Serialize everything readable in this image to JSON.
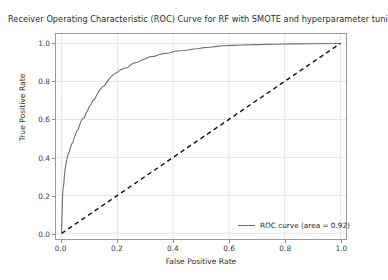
{
  "chart_data": {
    "type": "line",
    "title": "Receiver Operating Characteristic (ROC) Curve for RF with SMOTE and hyperparameter tuning",
    "xlabel": "False Positive Rate",
    "ylabel": "True Positive Rate",
    "xlim": [
      -0.02,
      1.02
    ],
    "ylim": [
      -0.03,
      1.05
    ],
    "xticks": [
      "0.0",
      "0.2",
      "0.4",
      "0.6",
      "0.8",
      "1.0"
    ],
    "xtick_values": [
      0.0,
      0.2,
      0.4,
      0.6,
      0.8,
      1.0
    ],
    "yticks": [
      "0.0",
      "0.2",
      "0.4",
      "0.6",
      "0.8",
      "1.0"
    ],
    "ytick_values": [
      0.0,
      0.2,
      0.4,
      0.6,
      0.8,
      1.0
    ],
    "grid": true,
    "grid_color": "#e6e6e6",
    "legend_position": "lower right",
    "series": [
      {
        "name": "ROC curve (area = 0.92)",
        "style": "solid",
        "color": "#6f6f6f",
        "auc": 0.92,
        "points": [
          [
            0.0,
            0.0
          ],
          [
            0.004,
            0.215
          ],
          [
            0.006,
            0.24
          ],
          [
            0.008,
            0.262
          ],
          [
            0.01,
            0.3
          ],
          [
            0.012,
            0.33
          ],
          [
            0.014,
            0.352
          ],
          [
            0.017,
            0.375
          ],
          [
            0.02,
            0.398
          ],
          [
            0.024,
            0.42
          ],
          [
            0.028,
            0.43
          ],
          [
            0.032,
            0.452
          ],
          [
            0.036,
            0.47
          ],
          [
            0.04,
            0.478
          ],
          [
            0.045,
            0.5
          ],
          [
            0.05,
            0.52
          ],
          [
            0.055,
            0.54
          ],
          [
            0.06,
            0.548
          ],
          [
            0.064,
            0.568
          ],
          [
            0.07,
            0.59
          ],
          [
            0.076,
            0.605
          ],
          [
            0.082,
            0.61
          ],
          [
            0.088,
            0.632
          ],
          [
            0.094,
            0.65
          ],
          [
            0.1,
            0.668
          ],
          [
            0.106,
            0.68
          ],
          [
            0.112,
            0.7
          ],
          [
            0.118,
            0.705
          ],
          [
            0.124,
            0.722
          ],
          [
            0.13,
            0.74
          ],
          [
            0.138,
            0.758
          ],
          [
            0.146,
            0.77
          ],
          [
            0.154,
            0.778
          ],
          [
            0.162,
            0.795
          ],
          [
            0.17,
            0.812
          ],
          [
            0.18,
            0.828
          ],
          [
            0.19,
            0.84
          ],
          [
            0.2,
            0.848
          ],
          [
            0.212,
            0.862
          ],
          [
            0.224,
            0.87
          ],
          [
            0.236,
            0.872
          ],
          [
            0.248,
            0.888
          ],
          [
            0.26,
            0.898
          ],
          [
            0.272,
            0.9
          ],
          [
            0.286,
            0.912
          ],
          [
            0.3,
            0.92
          ],
          [
            0.316,
            0.93
          ],
          [
            0.332,
            0.932
          ],
          [
            0.35,
            0.942
          ],
          [
            0.368,
            0.948
          ],
          [
            0.386,
            0.95
          ],
          [
            0.404,
            0.958
          ],
          [
            0.424,
            0.962
          ],
          [
            0.444,
            0.963
          ],
          [
            0.466,
            0.97
          ],
          [
            0.488,
            0.972
          ],
          [
            0.51,
            0.978
          ],
          [
            0.532,
            0.98
          ],
          [
            0.556,
            0.985
          ],
          [
            0.58,
            0.988
          ],
          [
            0.61,
            0.99
          ],
          [
            0.65,
            0.992
          ],
          [
            0.7,
            0.994
          ],
          [
            0.76,
            0.996
          ],
          [
            0.83,
            0.998
          ],
          [
            0.9,
            0.999
          ],
          [
            1.0,
            1.0
          ]
        ]
      },
      {
        "name": "chance-diagonal",
        "style": "dashed",
        "color": "#1a1a1a",
        "points": [
          [
            0.0,
            0.0
          ],
          [
            1.0,
            1.0
          ]
        ]
      }
    ]
  },
  "legend": {
    "entries": [
      {
        "label": "ROC curve (area = 0.92)"
      }
    ]
  }
}
